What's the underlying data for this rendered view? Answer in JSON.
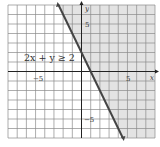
{
  "chart_data": {
    "type": "line",
    "title": "",
    "xlabel": "x",
    "ylabel": "y",
    "xlim": [
      -8,
      8
    ],
    "ylim": [
      -7,
      7
    ],
    "grid": true,
    "grid_step": 1,
    "tick_labels": {
      "x": [
        {
          "value": -5,
          "label": "−5"
        },
        {
          "value": 5,
          "label": "5"
        }
      ],
      "y": [
        {
          "value": 5,
          "label": "5"
        },
        {
          "value": -5,
          "label": "−5"
        }
      ]
    },
    "series": [
      {
        "name": "boundary line 2x + y = 2",
        "equation": "y = -2x + 2",
        "style": "solid",
        "x": [
          -2.5,
          4.5
        ],
        "y": [
          7,
          -7
        ]
      }
    ],
    "shaded_region": {
      "inequality": "2x + y ≥ 2",
      "side": "right/above the line",
      "color": "#e3e3e3"
    },
    "annotations": [
      {
        "text": "2x + y ≥ 2",
        "x": -6.3,
        "y": 1.5
      }
    ]
  },
  "labels": {
    "inequality": "2x + y ≥ 2",
    "x_axis": "x",
    "y_axis": "y",
    "x_tick_neg5": "−5",
    "x_tick_5": "5",
    "y_tick_5": "5",
    "y_tick_neg5": "−5"
  },
  "colors": {
    "shade": "#e3e3e3",
    "grid": "#8a8a8a",
    "axis": "#222222",
    "boundary": "#444444",
    "text": "#333333"
  }
}
